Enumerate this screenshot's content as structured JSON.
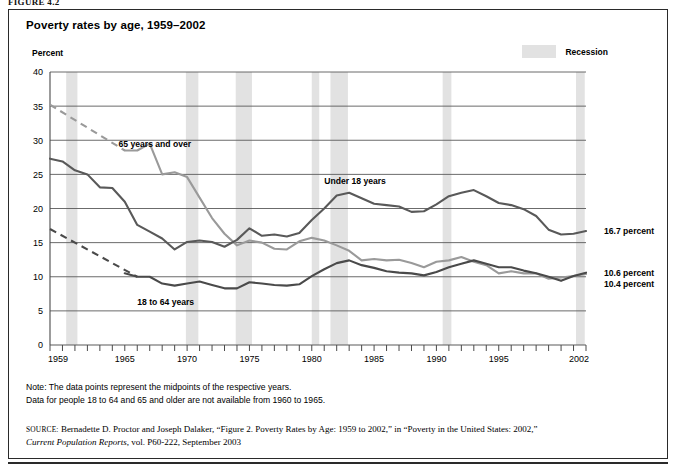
{
  "figure_label": "FIGURE 4.2",
  "title": "Poverty rates by age, 1959–2002",
  "axis": {
    "ylabel": "Percent",
    "yticks": [
      0,
      5,
      10,
      15,
      20,
      25,
      30,
      35,
      40
    ],
    "xticks_labeled": [
      "1959",
      "1965",
      "1970",
      "1975",
      "1980",
      "1985",
      "1990",
      "1995",
      "2002"
    ]
  },
  "legend": {
    "recession_label": "Recession",
    "recession_color": "#e2e2e2"
  },
  "series_labels": {
    "over65": "65 years and over",
    "under18": "Under 18 years",
    "adults": "18 to 64 years"
  },
  "end_labels": {
    "under18": "16.7 percent",
    "over65": "10.6 percent",
    "adults": "10.4 percent"
  },
  "notes": [
    "Note: The data points represent the midpoints of the respective years.",
    "Data for people 18 to 64 and 65 and older are not available from 1960 to 1965."
  ],
  "source": {
    "prefix": "source:",
    "line1": " Bernadette D. Proctor and Joseph Dalaker, “Figure 2. Poverty Rates by Age: 1959 to 2002,” in “Poverty in the United States: 2002,”",
    "italic": "Current Population Reports",
    "line2": ", vol. P60-222, September 2003"
  },
  "chart_data": {
    "type": "line",
    "title": "Poverty rates by age, 1959–2002",
    "xlabel": "",
    "ylabel": "Percent",
    "xlim": [
      1959,
      2002
    ],
    "ylim": [
      0,
      40
    ],
    "grid": true,
    "legend_position": "in-plot-annotations",
    "x": [
      1959,
      1960,
      1961,
      1962,
      1963,
      1964,
      1965,
      1966,
      1967,
      1968,
      1969,
      1970,
      1971,
      1972,
      1973,
      1974,
      1975,
      1976,
      1977,
      1978,
      1979,
      1980,
      1981,
      1982,
      1983,
      1984,
      1985,
      1986,
      1987,
      1988,
      1989,
      1990,
      1991,
      1992,
      1993,
      1994,
      1995,
      1996,
      1997,
      1998,
      1999,
      2000,
      2001,
      2002
    ],
    "series": [
      {
        "name": "65 years and over",
        "color": "#9a9a9a",
        "dashed_segment_years": [
          1959,
          1965
        ],
        "values": [
          35.2,
          null,
          null,
          null,
          null,
          null,
          28.5,
          28.5,
          29.5,
          25.0,
          25.3,
          24.6,
          21.6,
          18.6,
          16.3,
          14.6,
          15.3,
          15.0,
          14.1,
          14.0,
          15.2,
          15.7,
          15.3,
          14.6,
          13.8,
          12.4,
          12.6,
          12.4,
          12.5,
          12.0,
          11.4,
          12.2,
          12.4,
          12.9,
          12.2,
          11.7,
          10.5,
          10.8,
          10.5,
          10.5,
          9.7,
          9.9,
          10.1,
          10.4
        ]
      },
      {
        "name": "Under 18 years",
        "color": "#595959",
        "values": [
          27.3,
          26.9,
          25.6,
          25.0,
          23.1,
          23.0,
          21.0,
          17.6,
          16.6,
          15.6,
          14.0,
          15.1,
          15.3,
          15.1,
          14.4,
          15.4,
          17.1,
          16.0,
          16.2,
          15.9,
          16.4,
          18.3,
          20.0,
          21.9,
          22.3,
          21.5,
          20.7,
          20.5,
          20.3,
          19.5,
          19.6,
          20.6,
          21.8,
          22.3,
          22.7,
          21.8,
          20.8,
          20.5,
          19.9,
          18.9,
          16.9,
          16.2,
          16.3,
          16.7
        ]
      },
      {
        "name": "18 to 64 years",
        "color": "#4a4a4a",
        "dashed_segment_years": [
          1959,
          1966
        ],
        "values": [
          17.0,
          null,
          null,
          null,
          null,
          null,
          10.5,
          10.0,
          10.0,
          9.0,
          8.7,
          9.0,
          9.3,
          8.8,
          8.3,
          8.3,
          9.2,
          9.0,
          8.8,
          8.7,
          8.9,
          10.1,
          11.1,
          12.0,
          12.4,
          11.7,
          11.3,
          10.8,
          10.6,
          10.5,
          10.2,
          10.7,
          11.4,
          11.9,
          12.4,
          11.9,
          11.4,
          11.4,
          10.9,
          10.5,
          10.0,
          9.4,
          10.1,
          10.6
        ]
      }
    ],
    "recession_bands": [
      [
        1960.3,
        1961.2
      ],
      [
        1969.9,
        1970.9
      ],
      [
        1973.9,
        1975.2
      ],
      [
        1980.0,
        1980.6
      ],
      [
        1981.5,
        1982.9
      ],
      [
        1990.5,
        1991.2
      ],
      [
        2001.2,
        2001.9
      ]
    ],
    "annotations": [
      {
        "text": "65 years and over",
        "x": 1964.5,
        "y": 29.0
      },
      {
        "text": "Under 18 years",
        "x": 1981.0,
        "y": 23.6
      },
      {
        "text": "18 to 64 years",
        "x": 1966.0,
        "y": 5.9
      }
    ],
    "end_labels": [
      {
        "series": "Under 18 years",
        "text": "16.7 percent"
      },
      {
        "series": "65 years and over",
        "text": "10.6 percent"
      },
      {
        "series": "18 to 64 years",
        "text": "10.4 percent"
      }
    ]
  }
}
